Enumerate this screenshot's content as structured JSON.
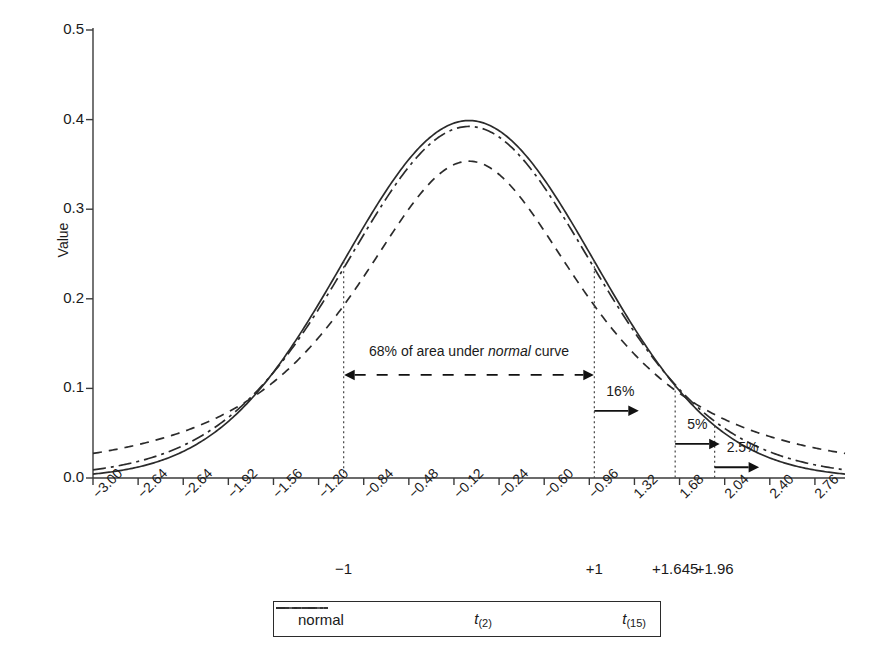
{
  "chart_data": {
    "type": "line",
    "title": "",
    "xlabel": "",
    "ylabel": "Value",
    "xlim": [
      -3.0,
      3.0
    ],
    "ylim": [
      0.0,
      0.5
    ],
    "grid": false,
    "legend_position": "bottom",
    "y_ticks": [
      "0.0",
      "0.1",
      "0.2",
      "0.3",
      "0.4",
      "0.5"
    ],
    "y_tick_values": [
      0.0,
      0.1,
      0.2,
      0.3,
      0.4,
      0.5
    ],
    "x_ticks": [
      "-3.00",
      "-2.64",
      "-2.64",
      "-1.92",
      "-1.56",
      "-1.20",
      "-0.84",
      "-0.48",
      "-0.12",
      "-0.24",
      "-0.60",
      "-0.96",
      "1.32",
      "1.68",
      "2.04",
      "2.40",
      "2.76"
    ],
    "x_tick_values": [
      -3.0,
      -2.64,
      -2.28,
      -1.92,
      -1.56,
      -1.2,
      -0.84,
      -0.48,
      -0.12,
      0.24,
      0.6,
      0.96,
      1.32,
      1.68,
      2.04,
      2.4,
      2.76
    ],
    "secondary_x_labels": [
      {
        "label": "-1",
        "value": -1.0
      },
      {
        "label": "+1",
        "value": 1.0
      },
      {
        "label": "+1.645",
        "value": 1.645
      },
      {
        "label": "+1.96",
        "value": 1.96
      }
    ],
    "series": [
      {
        "name": "normal",
        "style": "solid",
        "peak": 0.3989,
        "x": [
          -3.0,
          -2.76,
          -2.52,
          -2.28,
          -2.04,
          -1.8,
          -1.56,
          -1.32,
          -1.08,
          -0.84,
          -0.6,
          -0.36,
          -0.12,
          0.0,
          0.12,
          0.36,
          0.6,
          0.84,
          1.08,
          1.32,
          1.56,
          1.8,
          2.04,
          2.28,
          2.52,
          2.76,
          3.0
        ],
        "values": [
          0.0044,
          0.0088,
          0.0167,
          0.0297,
          0.0498,
          0.079,
          0.1182,
          0.1669,
          0.2227,
          0.2803,
          0.3332,
          0.3739,
          0.3961,
          0.3989,
          0.3961,
          0.3739,
          0.3332,
          0.2803,
          0.2227,
          0.1669,
          0.1182,
          0.079,
          0.0498,
          0.0297,
          0.0167,
          0.0088,
          0.0044
        ]
      },
      {
        "name": "t(2)",
        "style": "dashed",
        "peak": 0.3536,
        "x": [
          -3.0,
          -2.76,
          -2.52,
          -2.28,
          -2.04,
          -1.8,
          -1.56,
          -1.32,
          -1.08,
          -0.84,
          -0.6,
          -0.36,
          -0.12,
          0.0,
          0.12,
          0.36,
          0.6,
          0.84,
          1.08,
          1.32,
          1.56,
          1.8,
          2.04,
          2.28,
          2.52,
          2.76,
          3.0
        ],
        "values": [
          0.0274,
          0.0333,
          0.0409,
          0.0506,
          0.0633,
          0.0798,
          0.1012,
          0.1287,
          0.1632,
          0.2048,
          0.2522,
          0.3009,
          0.3427,
          0.3536,
          0.3427,
          0.3009,
          0.2522,
          0.2048,
          0.1632,
          0.1287,
          0.1012,
          0.0798,
          0.0633,
          0.0506,
          0.0409,
          0.0333,
          0.0274
        ]
      },
      {
        "name": "t(15)",
        "style": "dashdot",
        "peak": 0.3877,
        "x": [
          -3.0,
          -2.76,
          -2.52,
          -2.28,
          -2.04,
          -1.8,
          -1.56,
          -1.32,
          -1.08,
          -0.84,
          -0.6,
          -0.36,
          -0.12,
          0.0,
          0.12,
          0.36,
          0.6,
          0.84,
          1.08,
          1.32,
          1.56,
          1.8,
          2.04,
          2.28,
          2.52,
          2.76,
          3.0
        ],
        "values": [
          0.0082,
          0.0129,
          0.0201,
          0.0309,
          0.0468,
          0.0692,
          0.0993,
          0.1374,
          0.1822,
          0.2309,
          0.2786,
          0.3198,
          0.3476,
          0.3877,
          0.3476,
          0.3198,
          0.2786,
          0.2309,
          0.1822,
          0.1374,
          0.0993,
          0.0692,
          0.0468,
          0.0309,
          0.0201,
          0.0129,
          0.0082
        ]
      }
    ],
    "annotations": [
      {
        "name": "area-68",
        "text_prefix": "68% of area under ",
        "text_italic": "normal",
        "text_suffix": " curve",
        "from": -1.0,
        "to": 1.0,
        "y": 0.115,
        "arrow": "double"
      },
      {
        "name": "area-16",
        "text": "16%",
        "at": 1.0,
        "y": 0.075,
        "arrow": "right"
      },
      {
        "name": "area-5",
        "text": "5%",
        "at": 1.645,
        "y": 0.038,
        "arrow": "right"
      },
      {
        "name": "area-2p5",
        "text": "2.5%",
        "at": 1.96,
        "y": 0.012,
        "arrow": "right"
      }
    ],
    "guide_lines": [
      {
        "name": "guide-minus-1",
        "value": -1.0
      },
      {
        "name": "guide-plus-1",
        "value": 1.0
      },
      {
        "name": "guide-plus-1645",
        "value": 1.645
      },
      {
        "name": "guide-plus-196",
        "value": 1.96
      }
    ]
  },
  "legend": {
    "items": [
      {
        "label": "normal",
        "style": "solid"
      },
      {
        "label": "t",
        "sub": "(2)",
        "style": "dashed"
      },
      {
        "label": "t",
        "sub": "(15)",
        "style": "dashdot"
      }
    ]
  },
  "axes": {
    "y_title": "Value"
  }
}
